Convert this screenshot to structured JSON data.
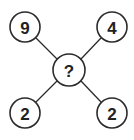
{
  "diagram": {
    "type": "number-puzzle",
    "center": {
      "label": "?",
      "cx": 69,
      "cy": 70,
      "r": 16
    },
    "nodes": [
      {
        "id": "top-left",
        "label": "9",
        "cx": 25,
        "cy": 27,
        "r": 15
      },
      {
        "id": "top-right",
        "label": "4",
        "cx": 112,
        "cy": 27,
        "r": 15
      },
      {
        "id": "bottom-left",
        "label": "2",
        "cx": 25,
        "cy": 113,
        "r": 15
      },
      {
        "id": "bottom-right",
        "label": "2",
        "cx": 112,
        "cy": 113,
        "r": 15
      }
    ],
    "colors": {
      "stroke": "#2b2b2b",
      "text": "#222222",
      "background": "#ffffff"
    }
  }
}
